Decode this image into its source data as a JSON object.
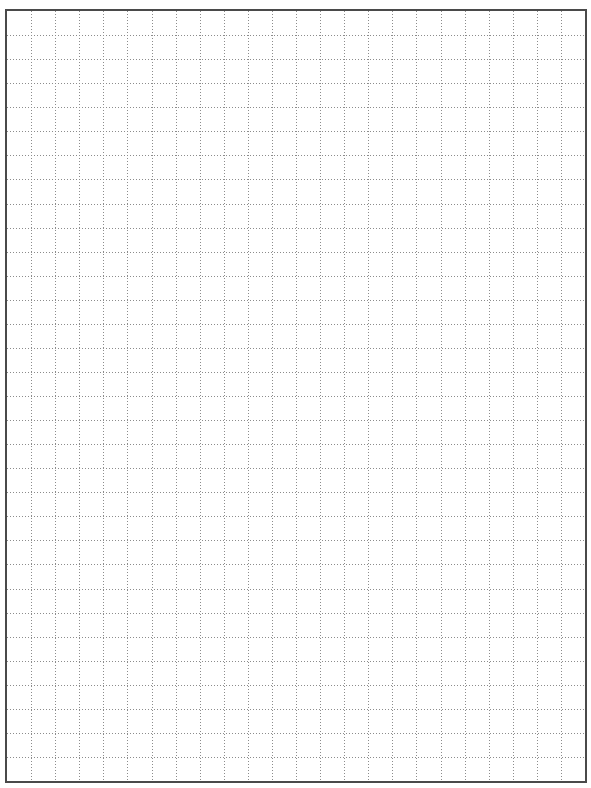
{
  "page": {
    "type": "graph-paper",
    "grid": {
      "columns": 24,
      "rows": 32,
      "cell_size_px": 24,
      "line_style": "dotted",
      "line_color": "#8c8c8c",
      "border_color": "#4a4a4a"
    }
  }
}
